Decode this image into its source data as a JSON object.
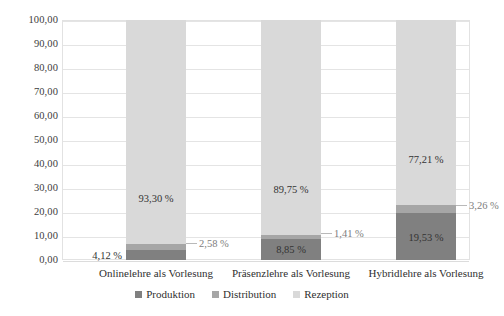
{
  "chart_data": {
    "type": "bar",
    "subtype": "stacked-100-percent",
    "title": "",
    "subtitle": "",
    "xlabel": "",
    "ylabel": "",
    "ylim": [
      0,
      100
    ],
    "ytick_step": 10,
    "grid": true,
    "legend_position": "bottom",
    "decimal_separator": ",",
    "value_suffix": " %",
    "categories": [
      "Onlinelehre als Vorlesung",
      "Präsenzlehre als Vorlesung",
      "Hybridlehre als Vorlesung"
    ],
    "ytick_labels": [
      "100,00",
      "90,00",
      "80,00",
      "70,00",
      "60,00",
      "50,00",
      "40,00",
      "30,00",
      "20,00",
      "10,00",
      "0,00"
    ],
    "ytick_values": [
      100,
      90,
      80,
      70,
      60,
      50,
      40,
      30,
      20,
      10,
      0
    ],
    "series": [
      {
        "name": "Produktion",
        "color": "#808080",
        "values": [
          4.12,
          8.85,
          19.53
        ],
        "labels": [
          "4,12 %",
          "8,85 %",
          "19,53 %"
        ],
        "label_placement": [
          "outside-left",
          "inside",
          "inside"
        ]
      },
      {
        "name": "Distribution",
        "color": "#a6a6a6",
        "values": [
          2.58,
          1.41,
          3.26
        ],
        "labels": [
          "2,58 %",
          "1,41 %",
          "3,26 %"
        ],
        "label_placement": [
          "callout-right",
          "callout-right",
          "callout-right"
        ]
      },
      {
        "name": "Rezeption",
        "color": "#d9d9d9",
        "values": [
          93.3,
          89.75,
          77.21
        ],
        "labels": [
          "93,30 %",
          "89,75 %",
          "77,21 %"
        ],
        "label_placement": [
          "inside",
          "inside",
          "inside"
        ]
      }
    ]
  },
  "legend": {
    "items": [
      {
        "label": "Produktion",
        "color": "#808080"
      },
      {
        "label": "Distribution",
        "color": "#a6a6a6"
      },
      {
        "label": "Rezeption",
        "color": "#d9d9d9"
      }
    ]
  },
  "axis": {
    "y_labels": [
      "100,00",
      "90,00",
      "80,00",
      "70,00",
      "60,00",
      "50,00",
      "40,00",
      "30,00",
      "20,00",
      "10,00",
      "0,00"
    ],
    "x_labels": [
      "Onlinelehre als Vorlesung",
      "Präsenzlehre als Vorlesung",
      "Hybridlehre als Vorlesung"
    ]
  },
  "annotations": {
    "bar1": {
      "produktion": "4,12 %",
      "distribution": "2,58 %",
      "rezeption": "93,30 %"
    },
    "bar2": {
      "produktion": "8,85 %",
      "distribution": "1,41 %",
      "rezeption": "89,75 %"
    },
    "bar3": {
      "produktion": "19,53 %",
      "distribution": "3,26 %",
      "rezeption": "77,21 %"
    }
  },
  "colors": {
    "produktion": "#808080",
    "distribution": "#a6a6a6",
    "rezeption": "#d9d9d9",
    "grid": "#e4e4e4",
    "frame": "#e2e2e2",
    "text": "#3d3d3d",
    "callout_text": "#7d7d7d",
    "background": "#ffffff"
  }
}
